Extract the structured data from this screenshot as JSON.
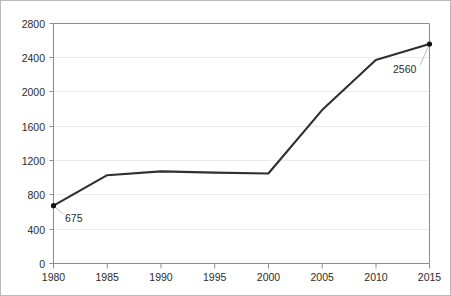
{
  "chart_data": {
    "type": "line",
    "title": "",
    "subtitle": "",
    "xlabel": "",
    "ylabel": "",
    "x": [
      1980,
      1985,
      1990,
      1995,
      2000,
      2005,
      2010,
      2015
    ],
    "values": [
      675,
      1030,
      1075,
      1060,
      1050,
      1790,
      2375,
      2560
    ],
    "series": [
      {
        "name": "",
        "values": [
          675,
          1030,
          1075,
          1060,
          1050,
          1790,
          2375,
          2560
        ]
      }
    ],
    "xtick_labels": [
      "1980",
      "1985",
      "1990",
      "1995",
      "2000",
      "2005",
      "2010",
      "2015"
    ],
    "ytick_labels": [
      "0",
      "400",
      "800",
      "1200",
      "1600",
      "2000",
      "2400",
      "2800"
    ],
    "yticks": [
      0,
      400,
      800,
      1200,
      1600,
      2000,
      2400,
      2800
    ],
    "xlim": [
      1980,
      2015
    ],
    "ylim": [
      0,
      2800
    ],
    "grid": true,
    "grid_axis": "y",
    "legend": false,
    "legend_position": "none",
    "annotations": [
      {
        "name": "first-point-label",
        "text": "675",
        "x": 1980,
        "y": 675,
        "label_x_px": 64,
        "label_y_px": 212
      },
      {
        "name": "last-point-label",
        "text": "2560",
        "x": 2015,
        "y": 2560,
        "label_x_px": 392,
        "label_y_px": 63
      }
    ],
    "markers": [
      {
        "name": "marker-1980",
        "x": 1980,
        "y": 675
      },
      {
        "name": "marker-2015",
        "x": 2015,
        "y": 2560
      }
    ],
    "colors": {
      "line": "#2f2f2f",
      "marker": "#111111",
      "grid": "#ebebeb",
      "axis": "#8c8c8c",
      "text": "#2b2b2b",
      "background": "#ffffff",
      "border": "#b9b9b9",
      "leader": "#bdbdbd"
    }
  }
}
